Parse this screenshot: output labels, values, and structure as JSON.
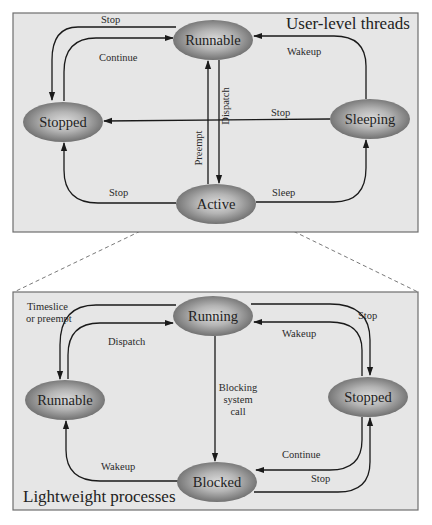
{
  "diagram": {
    "panels": {
      "top": {
        "title": "User-level threads"
      },
      "bottom": {
        "title": "Lightweight processes"
      }
    },
    "top_states": {
      "runnable": "Runnable",
      "stopped": "Stopped",
      "sleeping": "Sleeping",
      "active": "Active"
    },
    "top_edges": {
      "runnable_to_stopped": "Stop",
      "stopped_to_runnable": "Continue",
      "sleeping_to_runnable": "Wakeup",
      "runnable_to_active": "Dispatch",
      "active_to_runnable": "Preempt",
      "sleeping_to_stopped": "Stop",
      "active_to_stopped": "Stop",
      "active_to_sleeping": "Sleep"
    },
    "bottom_states": {
      "running": "Running",
      "runnable": "Runnable",
      "stopped": "Stopped",
      "blocked": "Blocked"
    },
    "bottom_edges": {
      "running_to_runnable_line1": "Timeslice",
      "running_to_runnable_line2": "or preempt",
      "runnable_to_running": "Dispatch",
      "running_to_stopped": "Stop",
      "stopped_to_running": "Wakeup",
      "running_to_blocked_line1": "Blocking",
      "running_to_blocked_line2": "system",
      "running_to_blocked_line3": "call",
      "blocked_to_runnable": "Wakeup",
      "stopped_to_blocked": "Continue",
      "blocked_to_stopped": "Stop"
    },
    "colors": {
      "panel_fill": "#e6e6e6",
      "panel_border": "#6e6e6e",
      "node_light": "#d4d4d4",
      "node_dark": "#6f6f6f",
      "edge": "#1a1a1a"
    }
  }
}
